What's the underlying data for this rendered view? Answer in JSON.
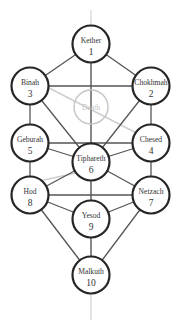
{
  "colors": {
    "node_stroke": "#262626",
    "path_stroke": "#555555",
    "hidden_node_stroke": "#c4c4c4",
    "axis_line": "#d9d9d9",
    "background": "#ffffff"
  },
  "nodes": [
    {
      "id": "kether",
      "name": "Kether",
      "number": "1"
    },
    {
      "id": "chokhmah",
      "name": "Chokhmah",
      "number": "2"
    },
    {
      "id": "binah",
      "name": "Binah",
      "number": "3"
    },
    {
      "id": "daath",
      "name": "Daath",
      "number": "",
      "hidden": true
    },
    {
      "id": "chesed",
      "name": "Chesed",
      "number": "4"
    },
    {
      "id": "geburah",
      "name": "Geburah",
      "number": "5"
    },
    {
      "id": "tiphareth",
      "name": "Tiphareth",
      "number": "6"
    },
    {
      "id": "netzach",
      "name": "Netzach",
      "number": "7"
    },
    {
      "id": "hod",
      "name": "Hod",
      "number": "8"
    },
    {
      "id": "yesod",
      "name": "Yesod",
      "number": "9"
    },
    {
      "id": "malkuth",
      "name": "Malkuth",
      "number": "10"
    }
  ],
  "paths": [
    [
      "kether",
      "chokhmah"
    ],
    [
      "kether",
      "binah"
    ],
    [
      "kether",
      "tiphareth"
    ],
    [
      "chokhmah",
      "binah"
    ],
    [
      "chokhmah",
      "chesed"
    ],
    [
      "chokhmah",
      "tiphareth"
    ],
    [
      "binah",
      "geburah"
    ],
    [
      "binah",
      "tiphareth"
    ],
    [
      "chesed",
      "geburah"
    ],
    [
      "chesed",
      "tiphareth"
    ],
    [
      "chesed",
      "netzach"
    ],
    [
      "geburah",
      "tiphareth"
    ],
    [
      "geburah",
      "hod"
    ],
    [
      "tiphareth",
      "netzach"
    ],
    [
      "tiphareth",
      "hod"
    ],
    [
      "tiphareth",
      "yesod"
    ],
    [
      "netzach",
      "hod"
    ],
    [
      "netzach",
      "yesod"
    ],
    [
      "netzach",
      "malkuth"
    ],
    [
      "hod",
      "yesod"
    ],
    [
      "hod",
      "malkuth"
    ],
    [
      "yesod",
      "malkuth"
    ]
  ]
}
